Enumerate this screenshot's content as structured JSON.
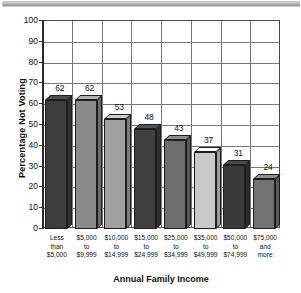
{
  "chart_data": {
    "type": "bar",
    "title": "",
    "xlabel": "Annual Family Income",
    "ylabel": "Percentage Not Voting",
    "categories": [
      "Less\nthan\n$5,000",
      "$5,000\nto\n$9,999",
      "$10,000\nto\n$14,999",
      "$15,000\nto\n$24,999",
      "$25,000\nto\n$34,999",
      "$35,000\nto\n$49,999",
      "$50,000\nto\n$74,999",
      "$75,000\nand\nmore"
    ],
    "values": [
      62,
      62,
      53,
      48,
      43,
      37,
      31,
      24
    ],
    "ylim": [
      0,
      100
    ],
    "yticks": [
      100,
      90,
      80,
      70,
      60,
      50,
      40,
      30,
      20,
      10,
      0
    ],
    "grid": "both",
    "legend": "none",
    "bar_colors": [
      "#3d3d3d",
      "#8a8a8a",
      "#a0a0a0",
      "#3f3f3f",
      "#6e6e6e",
      "#c9c9c9",
      "#3a3a3a",
      "#737373"
    ]
  },
  "axis": {
    "y_title": "Percentage Not Voting",
    "x_title": "Annual Family Income",
    "y_tick_labels": [
      "100",
      "90",
      "80",
      "70",
      "60",
      "50",
      "40",
      "30",
      "20",
      "10",
      "0"
    ]
  },
  "bars": [
    {
      "value_label": "62",
      "line1": "Less",
      "line2": "than",
      "line3": "$5,000"
    },
    {
      "value_label": "62",
      "line1": "$5,000",
      "line2": "to",
      "line3": "$9,999"
    },
    {
      "value_label": "53",
      "line1": "$10,000",
      "line2": "to",
      "line3": "$14,999"
    },
    {
      "value_label": "48",
      "line1": "$15,000",
      "line2": "to",
      "line3": "$24,999"
    },
    {
      "value_label": "43",
      "line1": "$25,000",
      "line2": "to",
      "line3": "$34,999"
    },
    {
      "value_label": "37",
      "line1": "$35,000",
      "line2": "to",
      "line3": "$49,999"
    },
    {
      "value_label": "31",
      "line1": "$50,000",
      "line2": "to",
      "line3": "$74,999"
    },
    {
      "value_label": "24",
      "line1": "$75,000",
      "line2": "and",
      "line3": "more"
    }
  ],
  "colors": {
    "axis": "#2b2b2b",
    "grid": "#777777",
    "text": "#111111",
    "rule": "#a9a9a9"
  }
}
